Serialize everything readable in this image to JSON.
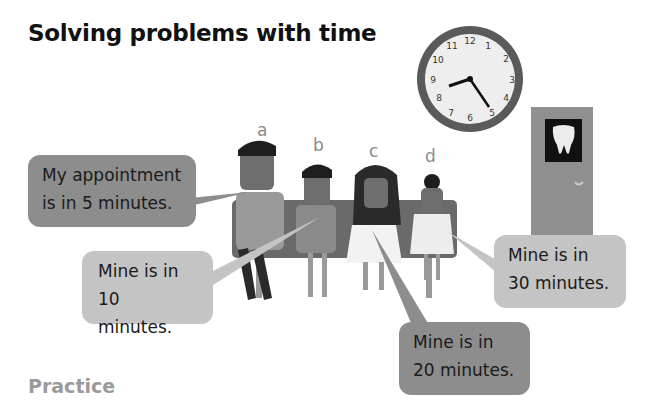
{
  "page": {
    "title": "Solving problems with time",
    "section_heading": "Practice"
  },
  "clock": {
    "numbers": [
      "12",
      "1",
      "2",
      "3",
      "4",
      "5",
      "6",
      "7",
      "8",
      "9",
      "10",
      "11"
    ],
    "time_shown": "8:25"
  },
  "door": {
    "sign_icon": "tooth-icon"
  },
  "characters": [
    {
      "label": "a",
      "speech": [
        "My appointment",
        "is in 5 minutes."
      ]
    },
    {
      "label": "b",
      "speech": [
        "Mine is in",
        "10 minutes."
      ]
    },
    {
      "label": "c",
      "speech": [
        "Mine is in",
        "20 minutes."
      ]
    },
    {
      "label": "d",
      "speech": [
        "Mine is in",
        "30 minutes."
      ]
    }
  ]
}
